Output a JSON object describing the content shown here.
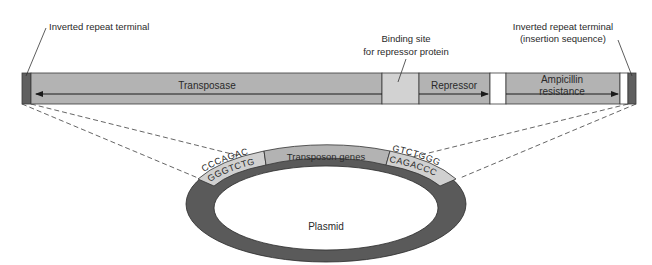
{
  "diagram": {
    "labels": {
      "left_terminal": "Inverted repeat terminal",
      "binding_site_line1": "Binding site",
      "binding_site_line2": "for repressor protein",
      "right_terminal_line1": "Inverted repeat terminal",
      "right_terminal_line2": "(insertion sequence)"
    },
    "bar_segments": [
      {
        "name": "Inverted repeat terminal (left)",
        "color": "#5f5f5f"
      },
      {
        "name": "Transposase",
        "label": "Transposase",
        "color": "#b3b3b3",
        "arrow": "left"
      },
      {
        "name": "Binding site for repressor protein",
        "color": "#d2d2d2"
      },
      {
        "name": "Repressor",
        "label": "Repressor",
        "color": "#b3b3b3",
        "arrow": "right"
      },
      {
        "name": "Gap",
        "color": "#ffffff"
      },
      {
        "name": "Ampicillin resistance",
        "label_line1": "Ampicillin",
        "label_line2": "resistance",
        "color": "#b3b3b3",
        "arrow": "right"
      },
      {
        "name": "Gap",
        "color": "#ffffff"
      },
      {
        "name": "Inverted repeat terminal (right)",
        "color": "#5f5f5f"
      }
    ],
    "plasmid": {
      "label": "Plasmid",
      "ring_color": "#5a5a5a",
      "insert_label": "Transposon genes",
      "insert_color": "#b3b3b3",
      "left_repeat": {
        "top": "CCCAGAC",
        "bottom": "GGGTCTG",
        "color": "#d0d0d0"
      },
      "right_repeat": {
        "top": "GTCTGGG",
        "bottom": "CAGACCC",
        "color": "#d0d0d0"
      }
    }
  }
}
